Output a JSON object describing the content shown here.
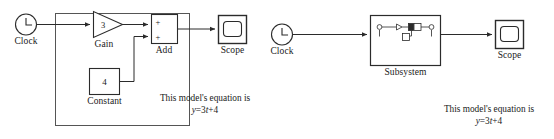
{
  "diagram": {
    "kind": "simulink-block-diagram",
    "stroke_color": "#2b2b2b",
    "text_color": "#1a1a1a",
    "background_color": "#ffffff",
    "selection_box_color": "#555555"
  },
  "left_model": {
    "title": "",
    "selection_box": {
      "visible": true
    },
    "blocks": [
      {
        "id": "clock",
        "type": "clock",
        "label": "Clock",
        "shape": "circle-with-clock-hands",
        "value": ""
      },
      {
        "id": "gain",
        "type": "gain",
        "label": "Gain",
        "shape": "triangle",
        "value": "3"
      },
      {
        "id": "add",
        "type": "sum",
        "label": "Add",
        "shape": "rectangle",
        "port_signs": [
          "+",
          "+"
        ]
      },
      {
        "id": "constant",
        "type": "constant",
        "label": "Constant",
        "shape": "rectangle",
        "value": "4"
      },
      {
        "id": "scope",
        "type": "scope",
        "label": "Scope",
        "shape": "rectangle-with-screen",
        "value": ""
      }
    ],
    "annotation": {
      "line1": "This model's equation is",
      "line2_html": "<em>y</em>=3<em>t</em>+4",
      "line2_plain": "y=3t+4"
    }
  },
  "right_model": {
    "blocks": [
      {
        "id": "clock",
        "type": "clock",
        "label": "Clock",
        "shape": "circle-with-clock-hands",
        "value": ""
      },
      {
        "id": "subsystem",
        "type": "subsystem",
        "label": "Subsystem",
        "shape": "rectangle-with-mini-diagram",
        "value": ""
      },
      {
        "id": "scope",
        "type": "scope",
        "label": "Scope",
        "shape": "rectangle-with-screen",
        "value": ""
      }
    ],
    "annotation": {
      "line1": "This model's equation is",
      "line2_html": "<em>y</em>=3<em>t</em>+4",
      "line2_plain": "y=3t+4"
    }
  }
}
